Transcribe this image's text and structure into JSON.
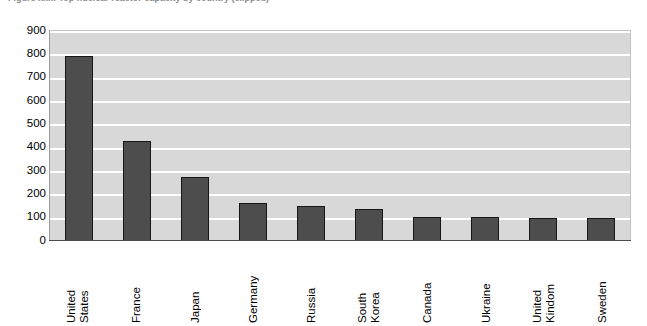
{
  "figure": {
    "caption": "Figure xxx: Top nuclear reactor capacity by country (clipped)",
    "caption_visible": false
  },
  "chart_data": {
    "type": "bar",
    "title": "",
    "subtitle": "",
    "xlabel": "",
    "ylabel": "",
    "ylim": [
      0,
      900
    ],
    "ytick_step": 100,
    "grid": true,
    "legend": false,
    "legend_position": "none",
    "orientation": "vertical",
    "bar_color": "#4d4d4d",
    "bar_border_color": "#161616",
    "plot_background": "#d8d8d8",
    "gridline_color": "#ffffff",
    "categories": [
      "United States",
      "France",
      "Japan",
      "Germany",
      "Russia",
      "South Korea",
      "Canada",
      "Ukraine",
      "United Kindom",
      "Sweden"
    ],
    "category_lines": [
      [
        "United",
        "States"
      ],
      [
        "France"
      ],
      [
        "Japan"
      ],
      [
        "Germany"
      ],
      [
        "Russia"
      ],
      [
        "South",
        "Korea"
      ],
      [
        "Canada"
      ],
      [
        "Ukraine"
      ],
      [
        "United",
        "Kindom"
      ],
      [
        "Sweden"
      ]
    ],
    "values": [
      795,
      430,
      275,
      165,
      148,
      138,
      103,
      102,
      100,
      100
    ],
    "ytick_labels": [
      "900",
      "800",
      "700",
      "600",
      "500",
      "400",
      "300",
      "200",
      "100",
      "0"
    ],
    "ytick_values": [
      900,
      800,
      700,
      600,
      500,
      400,
      300,
      200,
      100,
      0
    ]
  }
}
